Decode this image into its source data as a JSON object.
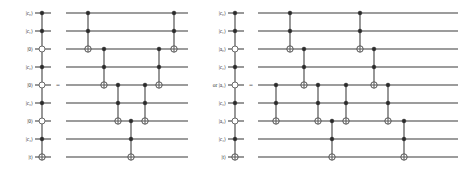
{
  "figure": {
    "type": "quantum-circuit-identity",
    "background_color": "#ffffff",
    "ink_color": "#2b2b2b",
    "panels": [
      {
        "id": "left-panel",
        "equality_symbol": "=",
        "wire_labels": [
          "|c₀⟩",
          "|c₁⟩",
          "|0⟩",
          "|c₂⟩",
          "|0⟩",
          "|c₃⟩",
          "|0⟩",
          "|c₄⟩",
          "|t⟩"
        ],
        "lhs_gate": {
          "name": "multi-controlled-not",
          "filled_controls": [
            0,
            1,
            3,
            5,
            7
          ],
          "open_controls": [
            2,
            4,
            6
          ],
          "target": 8
        },
        "rhs_gates": [
          {
            "name": "toffoli",
            "controls": [
              0,
              1
            ],
            "target": 2
          },
          {
            "name": "toffoli",
            "controls": [
              2,
              3
            ],
            "target": 4
          },
          {
            "name": "toffoli",
            "controls": [
              4,
              5
            ],
            "target": 6
          },
          {
            "name": "toffoli",
            "controls": [
              6,
              7
            ],
            "target": 8
          },
          {
            "name": "toffoli",
            "controls": [
              4,
              5
            ],
            "target": 6
          },
          {
            "name": "toffoli",
            "controls": [
              2,
              3
            ],
            "target": 4
          },
          {
            "name": "toffoli",
            "controls": [
              0,
              1
            ],
            "target": 2
          }
        ]
      },
      {
        "id": "right-panel",
        "equality_symbol": "=",
        "alt_prefix": "or",
        "wire_labels": [
          "|c₀⟩",
          "|c₁⟩",
          "|a₀⟩",
          "|c₂⟩",
          "|a₁⟩",
          "|c₃⟩",
          "|a₂⟩",
          "|c₄⟩",
          "|t⟩"
        ],
        "lhs_gate": {
          "name": "multi-controlled-not",
          "filled_controls": [
            0,
            1,
            3,
            5,
            7
          ],
          "open_controls": [
            2,
            4,
            6
          ],
          "target": 8
        },
        "rhs_gates": [
          {
            "name": "toffoli",
            "controls": [
              4,
              5
            ],
            "target": 6
          },
          {
            "name": "toffoli",
            "controls": [
              0,
              1
            ],
            "target": 2
          },
          {
            "name": "toffoli",
            "controls": [
              2,
              3
            ],
            "target": 4
          },
          {
            "name": "toffoli",
            "controls": [
              4,
              5
            ],
            "target": 6
          },
          {
            "name": "toffoli",
            "controls": [
              6,
              7
            ],
            "target": 8
          },
          {
            "name": "toffoli",
            "controls": [
              4,
              5
            ],
            "target": 6
          },
          {
            "name": "toffoli",
            "controls": [
              0,
              1
            ],
            "target": 2
          },
          {
            "name": "toffoli",
            "controls": [
              2,
              3
            ],
            "target": 4
          },
          {
            "name": "toffoli",
            "controls": [
              4,
              5
            ],
            "target": 6
          },
          {
            "name": "toffoli",
            "controls": [
              6,
              7
            ],
            "target": 8
          }
        ]
      }
    ]
  },
  "geometry": {
    "rows_y": [
      13,
      31,
      49,
      67,
      85,
      103,
      121,
      139,
      157
    ],
    "left_panel": {
      "label_x": 33,
      "lhs_wire_x0": 35,
      "lhs_wire_x1": 51,
      "lhs_gate_x": 42,
      "equals_x": 58,
      "rhs_wire_x0": 66,
      "rhs_wire_x1": 188,
      "rhs_columns": [
        88,
        104,
        118,
        131,
        145,
        159,
        174
      ]
    },
    "right_panel": {
      "label_x": 226,
      "lhs_wire_x0": 228,
      "lhs_wire_x1": 244,
      "lhs_gate_x": 235,
      "equals_x": 251,
      "rhs_wire_x0": 258,
      "rhs_wire_x1": 458,
      "rhs_columns": [
        276,
        290,
        304,
        318,
        332,
        346,
        360,
        374,
        388,
        404
      ]
    }
  }
}
